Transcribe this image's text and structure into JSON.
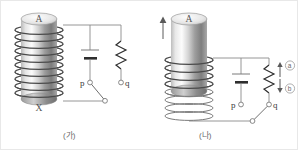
{
  "figure": {
    "background_color": "#ffffff",
    "line_color": "#8a8a8a",
    "coil_color": "#4a4a4a"
  },
  "panel_a": {
    "caption": "(가)",
    "magnet_top_label": "A",
    "magnet_bottom_label": "X",
    "terminal_p": "p",
    "terminal_q": "q",
    "battery_name": "battery",
    "resistor_name": "resistor",
    "switch_state": "closed-to-p"
  },
  "panel_b": {
    "caption": "(나)",
    "magnet_top_label": "A",
    "terminal_p": "p",
    "terminal_q": "q",
    "motion_arrow": "up",
    "current_label_up": "ⓐ",
    "current_label_down": "ⓑ",
    "current_label_up_letter": "a",
    "current_label_down_letter": "b",
    "switch_state": "closed-to-q"
  }
}
